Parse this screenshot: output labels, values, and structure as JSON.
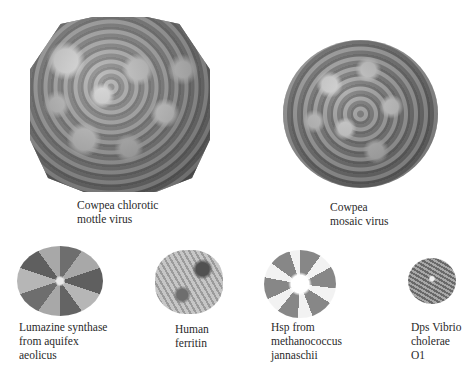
{
  "figure": {
    "panels": [
      {
        "id": "ccmv",
        "label": "Cowpea chlorotic\nmottle virus",
        "style": "grayscale surface rendering"
      },
      {
        "id": "cpmv",
        "label": "Cowpea\nmosaic virus",
        "style": "grayscale surface rendering"
      },
      {
        "id": "lumazine",
        "label": "Lumazine synthase\nfrom aquifex\naeolicus",
        "style": "grayscale ribbon rendering"
      },
      {
        "id": "ferritin",
        "label": "Human\nferritin",
        "style": "grayscale ribbon rendering"
      },
      {
        "id": "hsp",
        "label": "Hsp from\nmethanococcus\njannaschii",
        "style": "grayscale ribbon rendering"
      },
      {
        "id": "dps",
        "label": "Dps Vibrio\ncholerae\nO1",
        "style": "grayscale ribbon rendering"
      }
    ]
  }
}
